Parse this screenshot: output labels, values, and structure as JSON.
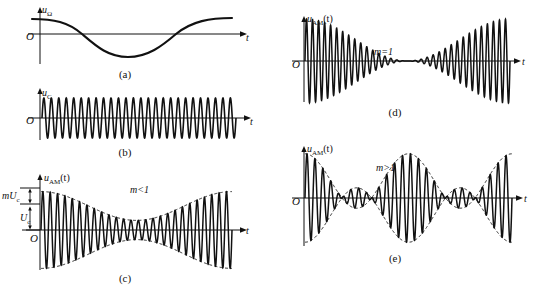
{
  "figure": {
    "title_visible": false,
    "panels": [
      {
        "id": "a",
        "caption": "(a)",
        "y_axis_label": "u",
        "y_axis_sub": "Ω",
        "x_axis_label": "t",
        "origin_label": "O",
        "annotation": "",
        "description": "modulating-signal-sine-wave"
      },
      {
        "id": "b",
        "caption": "(b)",
        "y_axis_label": "u",
        "y_axis_sub": "C",
        "x_axis_label": "t",
        "origin_label": "O",
        "annotation": "",
        "description": "carrier-constant-amplitude"
      },
      {
        "id": "c",
        "caption": "(c)",
        "y_axis_label": "u",
        "y_axis_sub": "AM",
        "y_axis_suffix": "(t)",
        "x_axis_label": "t",
        "origin_label": "O",
        "annotation": "m<1",
        "amp_label_1": "mU",
        "amp_label_1_sub": "c",
        "amp_label_2": "U",
        "amp_label_2_sub": "c",
        "description": "undermodulated-am-waveform"
      },
      {
        "id": "d",
        "caption": "(d)",
        "y_axis_label": "u",
        "y_axis_sub": "AM",
        "y_axis_suffix": "(t)",
        "x_axis_label": "t",
        "origin_label": "O",
        "annotation": "m=1",
        "description": "fully-modulated-am-waveform"
      },
      {
        "id": "e",
        "caption": "(e)",
        "y_axis_label": "u",
        "y_axis_sub": "AM",
        "y_axis_suffix": "(t)",
        "x_axis_label": "t",
        "origin_label": "O",
        "annotation": "m>1",
        "description": "overmodulated-am-waveform"
      }
    ]
  },
  "chart_data": {
    "type": "line",
    "title": "",
    "xlabel": "t",
    "ylabel": "u",
    "grid": false,
    "legend": "none",
    "plots": [
      {
        "id": "a",
        "name": "modulating signal",
        "waveform": "cosine",
        "amplitude": 1.0,
        "cycles": 1.0,
        "phase_deg": 0,
        "dc_offset": 0,
        "envelope": "none"
      },
      {
        "id": "b",
        "name": "carrier",
        "waveform": "sine",
        "amplitude": 1.0,
        "cycles": 26,
        "phase_deg": 0,
        "dc_offset": 0,
        "envelope": "constant"
      },
      {
        "id": "c",
        "name": "AM m<1",
        "waveform": "amplitude-modulated",
        "modulation_index": 0.6,
        "carrier_cycles": 26,
        "modulation_cycles": 1.0,
        "envelope": "dashed-cosine",
        "envelope_min": 0.4,
        "envelope_max": 1.6
      },
      {
        "id": "d",
        "name": "AM m=1",
        "waveform": "amplitude-modulated",
        "modulation_index": 1.0,
        "carrier_cycles": 34,
        "modulation_cycles": 1.0,
        "envelope": "cosine",
        "envelope_min": 0.0,
        "envelope_max": 2.0
      },
      {
        "id": "e",
        "name": "AM m>1",
        "waveform": "amplitude-modulated",
        "modulation_index": 1.6,
        "carrier_cycles": 26,
        "modulation_cycles": 2.0,
        "envelope": "dashed-rectified-cosine",
        "envelope_min": -0.6,
        "envelope_max": 2.6,
        "phase_reversal": true
      }
    ]
  }
}
